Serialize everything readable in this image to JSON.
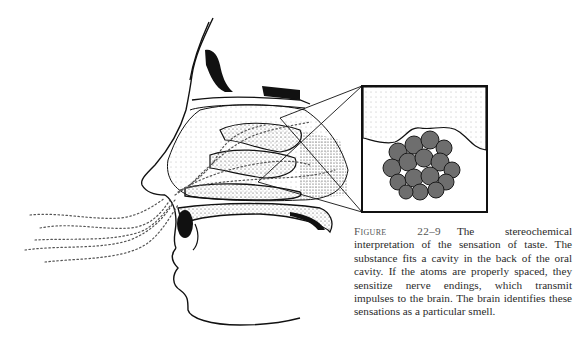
{
  "figure": {
    "label": "Figure 22–9",
    "caption": "The stereochemical interpretation of the sensation of taste. The substance fits a cavity in the back of the oral cavity. If the atoms are properly spaced, they sensitize nerve endings, which transmit impulses to the brain. The brain identifies these sensations as a particular smell.",
    "illustration": "Cross-section of human nasal cavity with inhaled odor particles and magnified inset showing a molecule cluster fitting a receptor cavity",
    "colors": {
      "ink": "#111111",
      "molecule": "#6e6e6e",
      "stipple": "#bdbdbd",
      "paper": "#ffffff"
    }
  }
}
